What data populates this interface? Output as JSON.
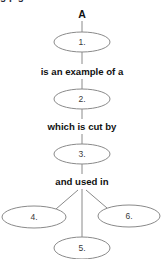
{
  "diagram": {
    "type": "concept-map",
    "root_label": "A",
    "colors": {
      "background": "#ffffff",
      "node_stroke": "#8a8a8a",
      "node_fill": "#ffffff",
      "edge_stroke": "#8a8a8a",
      "node_text": "#3a3a3a",
      "link_text": "#111111"
    },
    "nodes": [
      {
        "id": "n1",
        "label": "1.",
        "cx": 82,
        "cy": 42,
        "rx": 28,
        "ry": 10
      },
      {
        "id": "n2",
        "label": "2.",
        "cx": 82,
        "cy": 99,
        "rx": 28,
        "ry": 10
      },
      {
        "id": "n3",
        "label": "3.",
        "cx": 82,
        "cy": 154,
        "rx": 28,
        "ry": 10
      },
      {
        "id": "n4",
        "label": "4.",
        "cx": 34,
        "cy": 217,
        "rx": 32,
        "ry": 11
      },
      {
        "id": "n6",
        "label": "6.",
        "cx": 129,
        "cy": 216,
        "rx": 31,
        "ry": 11
      },
      {
        "id": "n5",
        "label": "5.",
        "cx": 82,
        "cy": 248,
        "rx": 28,
        "ry": 11
      }
    ],
    "link_labels": [
      {
        "text": "is an example of a",
        "x": 82,
        "y": 71
      },
      {
        "text": "which is cut by",
        "x": 82,
        "y": 126
      },
      {
        "text": "and used in",
        "x": 82,
        "y": 181
      }
    ],
    "edges": [
      {
        "from": "root",
        "to": "n1",
        "x1": 82,
        "y1": 21,
        "x2": 82,
        "y2": 32
      },
      {
        "from": "n1",
        "to": "label-1",
        "x1": 82,
        "y1": 52,
        "x2": 82,
        "y2": 64
      },
      {
        "from": "label-1",
        "to": "n2",
        "x1": 82,
        "y1": 79,
        "x2": 82,
        "y2": 89
      },
      {
        "from": "n2",
        "to": "label-2",
        "x1": 82,
        "y1": 109,
        "x2": 82,
        "y2": 119
      },
      {
        "from": "label-2",
        "to": "n3",
        "x1": 82,
        "y1": 134,
        "x2": 82,
        "y2": 144
      },
      {
        "from": "n3",
        "to": "label-3",
        "x1": 82,
        "y1": 164,
        "x2": 82,
        "y2": 174
      },
      {
        "from": "label-3",
        "to": "n4",
        "x1": 78,
        "y1": 190,
        "x2": 56,
        "y2": 209
      },
      {
        "from": "label-3",
        "to": "n6",
        "x1": 86,
        "y1": 190,
        "x2": 107,
        "y2": 208
      },
      {
        "from": "label-3",
        "to": "n5",
        "x1": 82,
        "y1": 189,
        "x2": 82,
        "y2": 237
      }
    ],
    "clipped_top_text": "g  p  g"
  }
}
